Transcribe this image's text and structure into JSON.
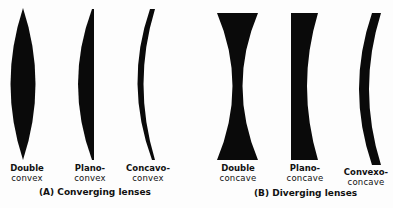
{
  "groups": [
    {
      "caption": "(A) Converging lenses",
      "lenses": [
        {
          "line1": "Double",
          "line2": "convex"
        },
        {
          "line1": "Plano-",
          "line2": "convex"
        },
        {
          "line1": "Concavo-",
          "line2": "convex"
        }
      ]
    },
    {
      "caption": "(B) Diverging lenses",
      "lenses": [
        {
          "line1": "Double",
          "line2": "concave"
        },
        {
          "line1": "Plano-",
          "line2": "concave"
        },
        {
          "line1": "Convexo-",
          "line2": "concave"
        }
      ]
    }
  ],
  "colors": {
    "lens_fill": "#0a0a0a",
    "background": "#fdfdfd"
  }
}
